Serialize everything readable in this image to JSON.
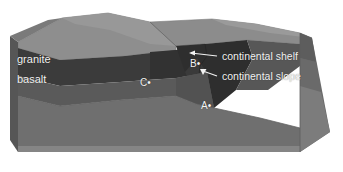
{
  "figure": {
    "kind": "block-diagram",
    "background_color": "#ffffff"
  },
  "layer_labels": [
    {
      "id": "granite",
      "text": "granite",
      "x": 17,
      "y": 58,
      "color": "#f2f2f2"
    },
    {
      "id": "basalt",
      "text": "basalt",
      "x": 17,
      "y": 78,
      "color": "#f2f2f2"
    }
  ],
  "annotations": [
    {
      "id": "continental-shelf",
      "text": "continental shelf",
      "x": 219,
      "y": 52,
      "leader": {
        "from_x": 216,
        "from_y": 57,
        "to_x": 190,
        "to_y": 54,
        "arrow": "left"
      }
    },
    {
      "id": "continental-slope",
      "text": "continental slope",
      "x": 219,
      "y": 72,
      "leader": {
        "from_x": 216,
        "from_y": 77,
        "to_x": 200,
        "to_y": 70,
        "arrow": "up-left"
      }
    }
  ],
  "points": [
    {
      "id": "point-a",
      "text": "A•",
      "x": 201,
      "y": 103
    },
    {
      "id": "point-b",
      "text": "B•",
      "x": 192,
      "y": 60
    },
    {
      "id": "point-c",
      "text": "C•",
      "x": 140,
      "y": 79
    }
  ],
  "palette": {
    "land_top": "#8e8e8e",
    "land_top_far": "#9a9a9a",
    "water_surface": "#8a8a8a",
    "water_surface_far": "#949494",
    "granite_front": "#3c3c3c",
    "granite_front_shelf": "#333333",
    "basalt_front": "#595959",
    "lower_body": "#6f6f6f",
    "right_side_granite": "#5e5e5e",
    "right_side_basalt": "#6a6a6a",
    "right_side_lower": "#7c7c7c",
    "left_side": "#555555",
    "base_band": "#868686",
    "water_wedge": "#2f2f2f",
    "slope_face": "#404040",
    "label_color": "#f2f2f2",
    "outline": "#4a4a4a"
  }
}
